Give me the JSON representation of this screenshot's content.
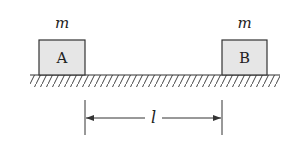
{
  "diagram": {
    "blocks": [
      {
        "label": "A",
        "mass_label": "m"
      },
      {
        "label": "B",
        "mass_label": "m"
      }
    ],
    "distance_label": "l",
    "colors": {
      "block_fill": "#e6e6e6",
      "stroke": "#333333",
      "background": "#ffffff"
    }
  }
}
